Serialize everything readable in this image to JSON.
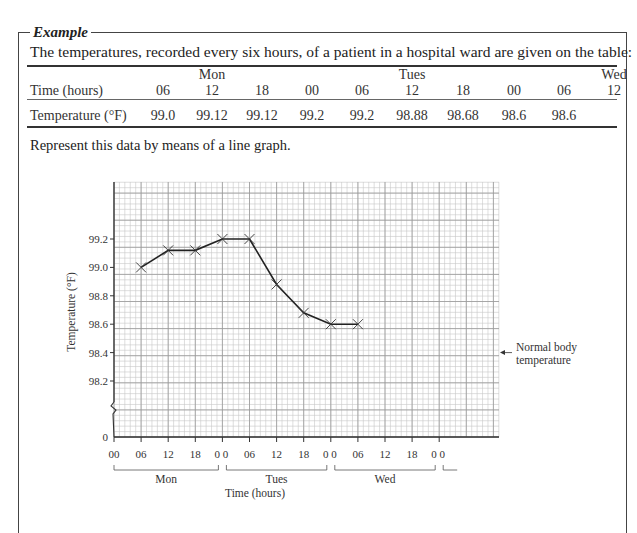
{
  "example": {
    "title": "Example",
    "intro": "The temperatures, recorded every six hours, of a patient in a hospital ward are given on the table:",
    "instruction": "Represent this data by means of a line graph."
  },
  "table": {
    "row_headers": [
      "Time (hours)",
      "Temperature (°F)"
    ],
    "day_labels": [
      {
        "col": 1,
        "label": "Mon"
      },
      {
        "col": 5,
        "label": "Tues"
      },
      {
        "col": 9,
        "label": "Wed"
      }
    ],
    "times": [
      "06",
      "12",
      "18",
      "00",
      "06",
      "12",
      "18",
      "00",
      "06",
      "12"
    ],
    "temperatures": [
      "99.0",
      "99.12",
      "99.12",
      "99.2",
      "99.2",
      "98.88",
      "98.68",
      "98.6",
      "98.6",
      ""
    ]
  },
  "chart_data": {
    "type": "line",
    "title": "",
    "xlabel": "Time (hours)",
    "ylabel": "Temperature (°F)",
    "x": [
      "Mon 06",
      "Mon 12",
      "Mon 18",
      "Tues 00",
      "Tues 06",
      "Tues 12",
      "Tues 18",
      "Wed 00",
      "Wed 06"
    ],
    "series": [
      {
        "name": "Temperature",
        "values": [
          99.0,
          99.12,
          99.12,
          99.2,
          99.2,
          98.88,
          98.68,
          98.6,
          98.6
        ]
      }
    ],
    "y_ticks": [
      "99.2",
      "99.0",
      "98.8",
      "98.6",
      "98.4",
      "98.2",
      "0"
    ],
    "x_ticks": [
      "00",
      "06",
      "12",
      "18",
      "0 0",
      "06",
      "12",
      "18",
      "0 0",
      "06",
      "12",
      "18",
      "0 0"
    ],
    "x_groups": [
      "Mon",
      "Tues",
      "Wed"
    ],
    "ylim": [
      98.0,
      99.5
    ],
    "axis_break": true,
    "grid": true,
    "marker": "x",
    "annotations": [
      {
        "text": "Normal body temperature",
        "y": 98.4,
        "arrow": "left"
      }
    ]
  }
}
